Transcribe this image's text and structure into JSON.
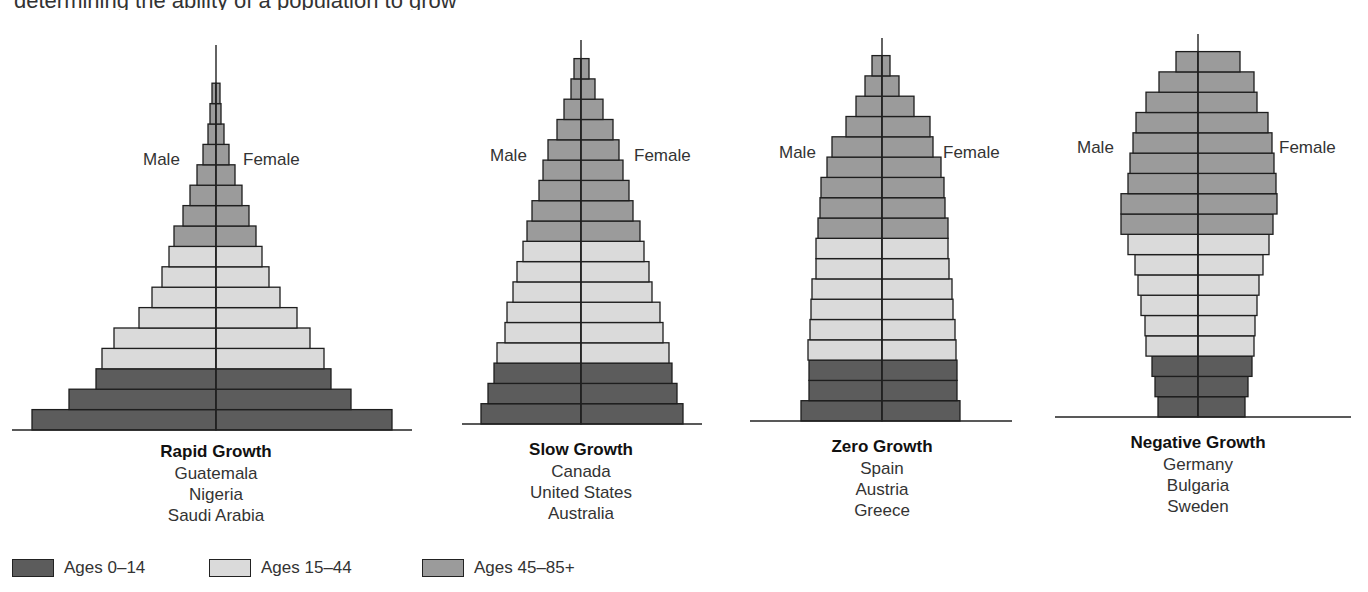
{
  "page": {
    "clipped_header_text": "determining the ability of a population to grow"
  },
  "axis_labels": {
    "male": "Male",
    "female": "Female"
  },
  "colors": {
    "ages_0_14": "#5c5c5c",
    "ages_15_44": "#dadada",
    "ages_45_85": "#9b9b9b",
    "outline": "#1e1e1e"
  },
  "legend": [
    {
      "label": "Ages 0–14",
      "color_key": "ages_0_14"
    },
    {
      "label": "Ages 15–44",
      "color_key": "ages_15_44"
    },
    {
      "label": "Ages 45–85+",
      "color_key": "ages_45_85"
    }
  ],
  "chart_data": [
    {
      "type": "population-pyramid",
      "title": "Rapid Growth",
      "countries": [
        "Guatemala",
        "Nigeria",
        "Saudi Arabia"
      ],
      "xlabel_left": "Male",
      "xlabel_right": "Female",
      "age_groups_bottom_to_top": [
        "0-4",
        "5-9",
        "10-14",
        "15-19",
        "20-24",
        "25-29",
        "30-34",
        "35-39",
        "40-44",
        "45-49",
        "50-54",
        "55-59",
        "60-64",
        "65-69",
        "70-74",
        "75-79",
        "80-84",
        "85+"
      ],
      "group_colors": [
        "ages_0_14",
        "ages_0_14",
        "ages_0_14",
        "ages_15_44",
        "ages_15_44",
        "ages_15_44",
        "ages_15_44",
        "ages_15_44",
        "ages_15_44",
        "ages_45_85",
        "ages_45_85",
        "ages_45_85",
        "ages_45_85",
        "ages_45_85",
        "ages_45_85",
        "ages_45_85",
        "ages_45_85"
      ],
      "male": [
        184,
        147,
        120,
        114,
        102,
        77,
        64,
        54,
        47,
        42,
        33,
        26,
        19,
        13,
        8,
        6,
        4
      ],
      "female": [
        176,
        135,
        115,
        108,
        94,
        81,
        64,
        53,
        46,
        40,
        33,
        26,
        19,
        13,
        8,
        5,
        4
      ],
      "layout": {
        "center_x": 216,
        "baseline_y": 430,
        "bar_height": 20.4,
        "axis_top_y": 45,
        "line_x0": 12,
        "line_x1": 412,
        "male_label_x": 143,
        "female_label_x": 243,
        "labels_y": 150,
        "title_y": 441
      }
    },
    {
      "type": "population-pyramid",
      "title": "Slow Growth",
      "countries": [
        "Canada",
        "United States",
        "Australia"
      ],
      "xlabel_left": "Male",
      "xlabel_right": "Female",
      "group_colors": [
        "ages_0_14",
        "ages_0_14",
        "ages_0_14",
        "ages_15_44",
        "ages_15_44",
        "ages_15_44",
        "ages_15_44",
        "ages_15_44",
        "ages_15_44",
        "ages_45_85",
        "ages_45_85",
        "ages_45_85",
        "ages_45_85",
        "ages_45_85",
        "ages_45_85",
        "ages_45_85",
        "ages_45_85",
        "ages_45_85"
      ],
      "male": [
        100,
        93,
        87,
        84,
        76,
        74,
        68,
        64,
        58,
        54,
        49,
        42,
        38,
        33,
        24,
        17,
        10,
        7
      ],
      "female": [
        102,
        96,
        91,
        88,
        82,
        79,
        71,
        68,
        63,
        59,
        52,
        48,
        42,
        38,
        32,
        22,
        14,
        8
      ],
      "layout": {
        "center_x": 581,
        "baseline_y": 424,
        "bar_height": 20.3,
        "axis_top_y": 40,
        "line_x0": 462,
        "line_x1": 702,
        "male_label_x": 490,
        "female_label_x": 634,
        "labels_y": 146,
        "title_y": 439
      }
    },
    {
      "type": "population-pyramid",
      "title": "Zero Growth",
      "countries": [
        "Spain",
        "Austria",
        "Greece"
      ],
      "xlabel_left": "Male",
      "xlabel_right": "Female",
      "group_colors": [
        "ages_0_14",
        "ages_0_14",
        "ages_0_14",
        "ages_15_44",
        "ages_15_44",
        "ages_15_44",
        "ages_15_44",
        "ages_15_44",
        "ages_15_44",
        "ages_45_85",
        "ages_45_85",
        "ages_45_85",
        "ages_45_85",
        "ages_45_85",
        "ages_45_85",
        "ages_45_85",
        "ages_45_85",
        "ages_45_85"
      ],
      "male": [
        81,
        73,
        73,
        74,
        72,
        71,
        70,
        66,
        66,
        64,
        62,
        61,
        55,
        50,
        36,
        26,
        17,
        10
      ],
      "female": [
        78,
        75,
        75,
        74,
        73,
        71,
        70,
        67,
        66,
        66,
        63,
        62,
        59,
        51,
        48,
        32,
        17,
        8
      ],
      "layout": {
        "center_x": 882,
        "baseline_y": 421,
        "bar_height": 20.3,
        "axis_top_y": 38,
        "line_x0": 750,
        "line_x1": 1012,
        "male_label_x": 779,
        "female_label_x": 943,
        "labels_y": 143,
        "title_y": 436
      }
    },
    {
      "type": "population-pyramid",
      "title": "Negative Growth",
      "countries": [
        "Germany",
        "Bulgaria",
        "Sweden"
      ],
      "xlabel_left": "Male",
      "xlabel_right": "Female",
      "group_colors": [
        "ages_0_14",
        "ages_0_14",
        "ages_0_14",
        "ages_15_44",
        "ages_15_44",
        "ages_15_44",
        "ages_15_44",
        "ages_15_44",
        "ages_15_44",
        "ages_45_85",
        "ages_45_85",
        "ages_45_85",
        "ages_45_85",
        "ages_45_85",
        "ages_45_85",
        "ages_45_85",
        "ages_45_85",
        "ages_45_85"
      ],
      "male": [
        40,
        43,
        46,
        52,
        53,
        57,
        60,
        63,
        70,
        77,
        77,
        70,
        68,
        65,
        62,
        52,
        39,
        22
      ],
      "female": [
        47,
        50,
        54,
        56,
        57,
        59,
        61,
        65,
        71,
        75,
        79,
        78,
        76,
        74,
        70,
        59,
        56,
        42
      ],
      "layout": {
        "center_x": 1198,
        "baseline_y": 417,
        "bar_height": 20.3,
        "axis_top_y": 34,
        "line_x0": 1055,
        "line_x1": 1351,
        "male_label_x": 1077,
        "female_label_x": 1279,
        "labels_y": 138,
        "title_y": 432
      }
    }
  ]
}
